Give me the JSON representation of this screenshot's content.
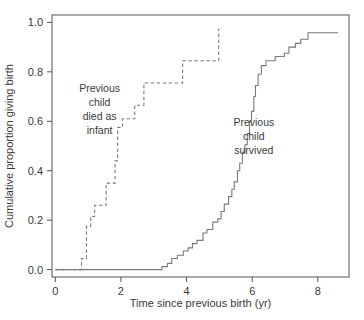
{
  "chart_data": {
    "type": "line",
    "subtype": "step",
    "title": "",
    "xlabel": "Time since previous birth (yr)",
    "ylabel": "Cumulative proportion giving birth",
    "xlim": [
      -0.1,
      8.95
    ],
    "ylim": [
      -0.03,
      1.03
    ],
    "xticks": [
      0,
      2,
      4,
      6,
      8
    ],
    "xticklabels": [
      "0",
      "2",
      "4",
      "6",
      "8"
    ],
    "yticks": [
      0.0,
      0.2,
      0.4,
      0.6,
      0.8,
      1.0
    ],
    "yticklabels": [
      "0.0",
      "0.2",
      "0.4",
      "0.6",
      "0.8",
      "1.0"
    ],
    "grid": false,
    "legend": "none",
    "box": "full",
    "colors": {
      "line": "#7a7a7a",
      "axis": "#555555",
      "text": "#3a3a3a"
    },
    "annotations": [
      {
        "name": "previous-child-died-as-infant",
        "lines": [
          "Previous",
          "child",
          "died as",
          "infant"
        ],
        "x": 1.35,
        "y": 0.72
      },
      {
        "name": "previous-child-survived",
        "lines": [
          "Previous",
          "child",
          "survived"
        ],
        "x": 6.05,
        "y": 0.58
      }
    ],
    "series": [
      {
        "name": "Previous child died as infant",
        "style": "dashed",
        "points": [
          [
            0.0,
            0.0
          ],
          [
            0.8,
            0.0
          ],
          [
            0.8,
            0.045
          ],
          [
            0.95,
            0.045
          ],
          [
            0.95,
            0.175
          ],
          [
            1.08,
            0.175
          ],
          [
            1.08,
            0.215
          ],
          [
            1.2,
            0.215
          ],
          [
            1.2,
            0.26
          ],
          [
            1.55,
            0.26
          ],
          [
            1.55,
            0.35
          ],
          [
            1.82,
            0.35
          ],
          [
            1.82,
            0.44
          ],
          [
            1.9,
            0.44
          ],
          [
            1.9,
            0.575
          ],
          [
            2.05,
            0.575
          ],
          [
            2.05,
            0.61
          ],
          [
            2.42,
            0.61
          ],
          [
            2.42,
            0.665
          ],
          [
            2.7,
            0.665
          ],
          [
            2.7,
            0.755
          ],
          [
            3.88,
            0.755
          ],
          [
            3.88,
            0.845
          ],
          [
            4.98,
            0.845
          ],
          [
            4.98,
            0.975
          ]
        ]
      },
      {
        "name": "Previous child survived",
        "style": "solid",
        "points": [
          [
            0.0,
            0.0
          ],
          [
            3.25,
            0.0
          ],
          [
            3.25,
            0.012
          ],
          [
            3.42,
            0.012
          ],
          [
            3.42,
            0.025
          ],
          [
            3.55,
            0.025
          ],
          [
            3.55,
            0.045
          ],
          [
            3.72,
            0.045
          ],
          [
            3.72,
            0.058
          ],
          [
            3.9,
            0.058
          ],
          [
            3.9,
            0.075
          ],
          [
            4.05,
            0.075
          ],
          [
            4.05,
            0.088
          ],
          [
            4.18,
            0.088
          ],
          [
            4.18,
            0.105
          ],
          [
            4.32,
            0.105
          ],
          [
            4.32,
            0.118
          ],
          [
            4.5,
            0.118
          ],
          [
            4.5,
            0.148
          ],
          [
            4.62,
            0.148
          ],
          [
            4.62,
            0.162
          ],
          [
            4.8,
            0.162
          ],
          [
            4.8,
            0.192
          ],
          [
            4.95,
            0.192
          ],
          [
            4.95,
            0.205
          ],
          [
            5.05,
            0.205
          ],
          [
            5.05,
            0.235
          ],
          [
            5.15,
            0.235
          ],
          [
            5.15,
            0.265
          ],
          [
            5.28,
            0.265
          ],
          [
            5.28,
            0.295
          ],
          [
            5.38,
            0.295
          ],
          [
            5.38,
            0.325
          ],
          [
            5.45,
            0.325
          ],
          [
            5.45,
            0.355
          ],
          [
            5.55,
            0.355
          ],
          [
            5.55,
            0.4
          ],
          [
            5.62,
            0.4
          ],
          [
            5.62,
            0.43
          ],
          [
            5.7,
            0.43
          ],
          [
            5.7,
            0.475
          ],
          [
            5.78,
            0.475
          ],
          [
            5.78,
            0.505
          ],
          [
            5.85,
            0.505
          ],
          [
            5.85,
            0.55
          ],
          [
            5.92,
            0.55
          ],
          [
            5.92,
            0.6
          ],
          [
            5.98,
            0.6
          ],
          [
            5.98,
            0.64
          ],
          [
            6.05,
            0.64
          ],
          [
            6.05,
            0.7
          ],
          [
            6.1,
            0.7
          ],
          [
            6.1,
            0.745
          ],
          [
            6.18,
            0.745
          ],
          [
            6.18,
            0.79
          ],
          [
            6.28,
            0.79
          ],
          [
            6.28,
            0.825
          ],
          [
            6.42,
            0.825
          ],
          [
            6.42,
            0.845
          ],
          [
            6.7,
            0.845
          ],
          [
            6.7,
            0.862
          ],
          [
            6.98,
            0.862
          ],
          [
            6.98,
            0.875
          ],
          [
            7.12,
            0.875
          ],
          [
            7.12,
            0.9
          ],
          [
            7.32,
            0.9
          ],
          [
            7.32,
            0.915
          ],
          [
            7.48,
            0.915
          ],
          [
            7.48,
            0.932
          ],
          [
            7.7,
            0.932
          ],
          [
            7.7,
            0.958
          ],
          [
            8.62,
            0.958
          ]
        ]
      }
    ]
  }
}
